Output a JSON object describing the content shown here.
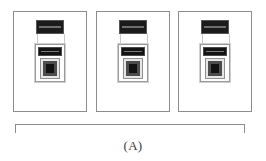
{
  "figure": {
    "caption": "(A)",
    "panel_count": 3,
    "panels": [
      {
        "id": "panel-1",
        "label": "",
        "device": {
          "top_module_label": "",
          "lower_module_label": "",
          "screen_label": ""
        }
      },
      {
        "id": "panel-2",
        "label": "",
        "device": {
          "top_module_label": "",
          "lower_module_label": "",
          "screen_label": ""
        }
      },
      {
        "id": "panel-3",
        "label": "",
        "device": {
          "top_module_label": "",
          "lower_module_label": "",
          "screen_label": ""
        }
      }
    ]
  },
  "colors": {
    "background": "#ffffff",
    "panel_border": "#8d8d8d",
    "bracket": "#8d8d8d",
    "module_dark": "#1b1b1b",
    "module_mid_gray": "#4d4d4d",
    "module_light_gray": "#e6e6e6",
    "caption_text": "#3a3a3a"
  }
}
